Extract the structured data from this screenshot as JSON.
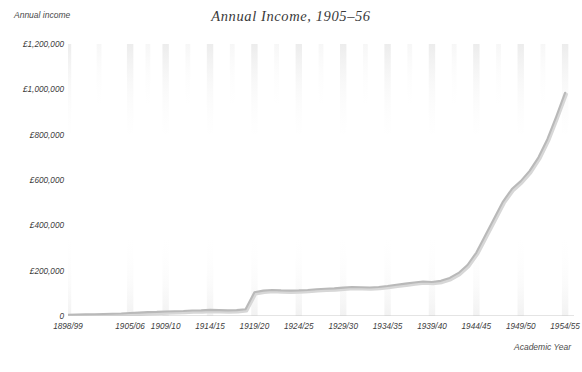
{
  "chart_data": {
    "type": "line",
    "title": "Annual Income, 1905–56",
    "xlabel": "Academic Year",
    "ylabel": "Annual income",
    "ylim": [
      0,
      1200000
    ],
    "xlim": [
      0,
      57
    ],
    "grid": true,
    "legend": null,
    "ytick_labels": [
      "£1,200,000",
      "£1,000,000",
      "£800,000",
      "£600,000",
      "£400,000",
      "£200,000",
      "0"
    ],
    "ytick_values": [
      1200000,
      1000000,
      800000,
      600000,
      400000,
      200000,
      0
    ],
    "xtick_labels": [
      "1898/99",
      "1905/06",
      "1909/10",
      "1914/15",
      "1919/20",
      "1924/25",
      "1929/30",
      "1934/35",
      "1939/40",
      "1944/45",
      "1949/50",
      "1954/55"
    ],
    "xtick_positions": [
      0,
      7,
      11,
      16,
      21,
      26,
      31,
      36,
      41,
      46,
      51,
      56
    ],
    "series": [
      {
        "name": "Annual income",
        "color": "#b9b9b9",
        "x": [
          0,
          1,
          2,
          3,
          4,
          5,
          6,
          7,
          8,
          9,
          10,
          11,
          12,
          13,
          14,
          15,
          16,
          17,
          18,
          19,
          20,
          21,
          22,
          23,
          24,
          25,
          26,
          27,
          28,
          29,
          30,
          31,
          32,
          33,
          34,
          35,
          36,
          37,
          38,
          39,
          40,
          41,
          42,
          43,
          44,
          45,
          46,
          47,
          48,
          49,
          50,
          51,
          52,
          53,
          54,
          55,
          56
        ],
        "x_labels": [
          "1898/99",
          "1899/00",
          "1900/01",
          "1901/02",
          "1902/03",
          "1903/04",
          "1904/05",
          "1905/06",
          "1906/07",
          "1907/08",
          "1908/09",
          "1909/10",
          "1910/11",
          "1911/12",
          "1912/13",
          "1913/14",
          "1914/15",
          "1915/16",
          "1916/17",
          "1917/18",
          "1918/19",
          "1919/20",
          "1920/21",
          "1921/22",
          "1922/23",
          "1923/24",
          "1924/25",
          "1925/26",
          "1926/27",
          "1927/28",
          "1928/29",
          "1929/30",
          "1930/31",
          "1931/32",
          "1932/33",
          "1933/34",
          "1934/35",
          "1935/36",
          "1936/37",
          "1937/38",
          "1938/39",
          "1939/40",
          "1940/41",
          "1941/42",
          "1942/43",
          "1943/44",
          "1944/45",
          "1945/46",
          "1946/47",
          "1947/48",
          "1948/49",
          "1949/50",
          "1950/51",
          "1951/52",
          "1952/53",
          "1953/54",
          "1954/55"
        ],
        "values": [
          5000,
          6000,
          7000,
          8000,
          9000,
          10000,
          11000,
          13000,
          15000,
          17000,
          18000,
          20000,
          21000,
          22000,
          24000,
          25000,
          27000,
          26000,
          25000,
          26000,
          30000,
          105000,
          112000,
          115000,
          113000,
          112000,
          113000,
          115000,
          118000,
          120000,
          122000,
          125000,
          128000,
          127000,
          126000,
          128000,
          132000,
          138000,
          143000,
          148000,
          152000,
          150000,
          155000,
          168000,
          190000,
          225000,
          280000,
          355000,
          430000,
          505000,
          560000,
          595000,
          640000,
          700000,
          780000,
          880000,
          985000
        ]
      }
    ],
    "annotations": []
  },
  "title": {
    "text": "Annual Income, 1905–56"
  },
  "axes": {
    "y_title": "Annual income",
    "x_title": "Academic Year"
  },
  "footer": {
    "mark": ""
  }
}
